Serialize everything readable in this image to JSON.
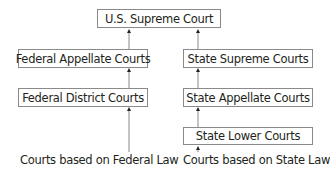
{
  "diagram": {
    "nodes": {
      "supreme": "U.S. Supreme Court",
      "fed_appellate": "Federal Appellate Courts",
      "fed_district": "Federal District Courts",
      "state_supreme": "State Supreme Courts",
      "state_appellate": "State Appellate Courts",
      "state_lower": "State Lower Courts"
    },
    "sources": {
      "federal": "Courts based on Federal Law",
      "state": "Courts based on State Law"
    },
    "edges": [
      [
        "fed_appellate",
        "supreme"
      ],
      [
        "state_supreme",
        "supreme"
      ],
      [
        "fed_district",
        "fed_appellate"
      ],
      [
        "state_appellate",
        "state_supreme"
      ],
      [
        "state_lower",
        "state_appellate"
      ],
      [
        "federal",
        "fed_district"
      ],
      [
        "state",
        "state_lower"
      ]
    ]
  }
}
